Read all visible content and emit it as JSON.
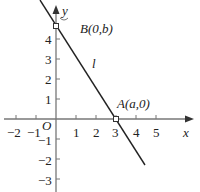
{
  "figure": {
    "x_axis_label": "x",
    "y_axis_label": "y",
    "origin_label": "O",
    "line_label": "l",
    "point_a_label": "A(a,0)",
    "point_b_label": "B(0,b)",
    "x_ticks": [
      "−2",
      "−1",
      "1",
      "2",
      "3",
      "4",
      "5"
    ],
    "y_ticks": [
      "4",
      "3",
      "2",
      "1",
      "−1",
      "−2",
      "−3"
    ],
    "colors": {
      "axis": "#888888",
      "line": "#222222"
    }
  }
}
